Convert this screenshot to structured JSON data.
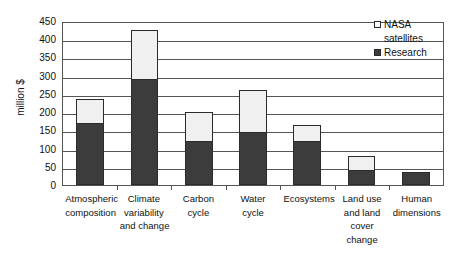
{
  "chart_data": {
    "type": "bar",
    "subtype": "stacked-column",
    "title": "",
    "xlabel": "",
    "ylabel": "million $",
    "ylim": [
      0,
      450
    ],
    "ytick_step": 50,
    "yticks": [
      450,
      400,
      350,
      300,
      250,
      200,
      150,
      100,
      50,
      0
    ],
    "grid": true,
    "legend_position": "top-right",
    "categories": [
      "Atmospheric composition",
      "Climate variability and change",
      "Carbon cycle",
      "Water cycle",
      "Ecosystems",
      "Land use and land cover change",
      "Human dimensions"
    ],
    "category_lines": [
      [
        "Atmospheric",
        "composition"
      ],
      [
        "Climate",
        "variability",
        "and change"
      ],
      [
        "Carbon",
        "cycle"
      ],
      [
        "Water",
        "cycle"
      ],
      [
        "Ecosystems"
      ],
      [
        "Land use",
        "and land",
        "cover",
        "change"
      ],
      [
        "Human",
        "dimensions"
      ]
    ],
    "series": [
      {
        "name": "Research",
        "color": "#3c3c3c",
        "values": [
          170,
          290,
          120,
          145,
          120,
          40,
          35
        ]
      },
      {
        "name": "NASA satellites",
        "color": "#f0f0f0",
        "values": [
          65,
          135,
          80,
          115,
          45,
          40,
          0
        ]
      }
    ],
    "totals": [
      235,
      425,
      200,
      260,
      165,
      80,
      35
    ]
  },
  "legend": {
    "entries": [
      {
        "label_line1": "NASA",
        "label_line2": "satellites",
        "swatch": "white-square"
      },
      {
        "label_line1": "Research",
        "label_line2": "",
        "swatch": "dark-square"
      }
    ]
  }
}
